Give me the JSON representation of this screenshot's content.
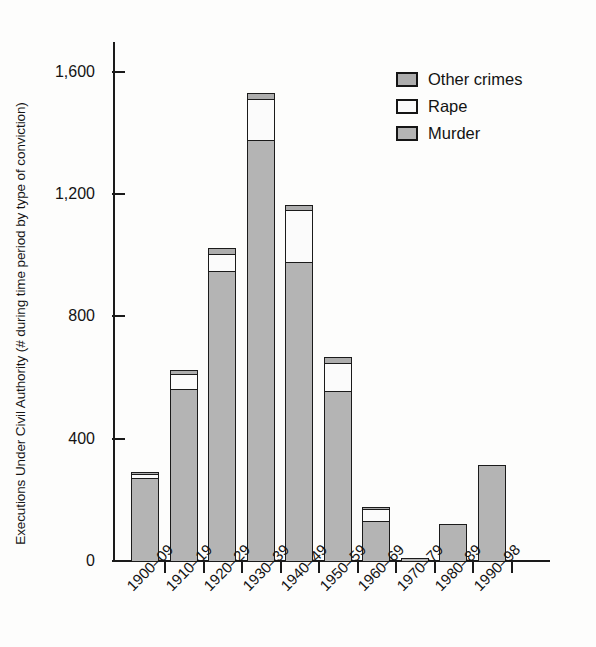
{
  "chart_data": {
    "type": "bar",
    "stacked": true,
    "title": "",
    "xlabel": "",
    "ylabel": "Executions Under Civil Authority (# during time period by type of conviction)",
    "categories": [
      "1900–09",
      "1910–19",
      "1920–29",
      "1930–39",
      "1940–49",
      "1950–59",
      "1960–69",
      "1970–79",
      "1980–89",
      "1990–98"
    ],
    "series": [
      {
        "name": "Murder",
        "color": "#b4b4b4",
        "values": [
          275,
          565,
          950,
          1380,
          980,
          560,
          135,
          3,
          123,
          318
        ]
      },
      {
        "name": "Rape",
        "color": "#fbfbfb",
        "values": [
          18,
          55,
          62,
          140,
          175,
          95,
          45,
          0,
          0,
          0
        ]
      },
      {
        "name": "Other crimes",
        "color": "#adadad",
        "values": [
          10,
          20,
          26,
          25,
          22,
          25,
          10,
          0,
          0,
          0
        ]
      }
    ],
    "totals": [
      303,
      640,
      1038,
      1545,
      1177,
      680,
      190,
      3,
      123,
      318
    ],
    "ylim": [
      0,
      1700
    ],
    "yticks": [
      0,
      400,
      800,
      1200,
      1600
    ],
    "ytick_labels": [
      "0",
      "400",
      "800",
      "1,200",
      "1,600"
    ],
    "grid": false,
    "legend_position": "top-right",
    "legend_order": [
      "Other crimes",
      "Rape",
      "Murder"
    ]
  },
  "legend": {
    "items": [
      {
        "label": "Other crimes",
        "swatch": "#adadad"
      },
      {
        "label": "Rape",
        "swatch": "#fbfbfb"
      },
      {
        "label": "Murder",
        "swatch": "#b4b4b4"
      }
    ]
  },
  "axis": {
    "y_title": "Executions Under Civil Authority (# during time period by type of conviction)"
  }
}
